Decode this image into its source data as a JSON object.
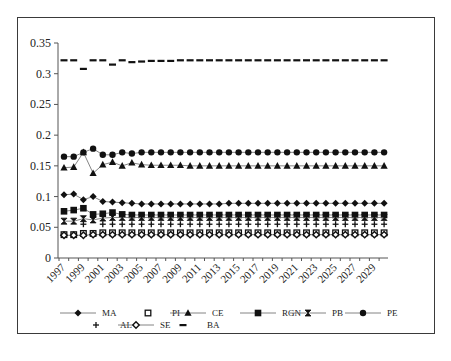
{
  "chart_data": {
    "type": "line",
    "title": "",
    "xlabel": "",
    "ylabel": "",
    "ylim": [
      0,
      0.35
    ],
    "yticks": [
      "0",
      "0.05",
      "0.1",
      "0.15",
      "0.2",
      "0.25",
      "0.3",
      "0.35"
    ],
    "xtick_labels": [
      "1997",
      "1999",
      "2001",
      "2003",
      "2005",
      "2007",
      "2009",
      "2011",
      "2013",
      "2015",
      "2017",
      "2019",
      "2021",
      "2023",
      "2025",
      "2027",
      "2029"
    ],
    "x": [
      1997,
      1998,
      1999,
      2000,
      2001,
      2002,
      2003,
      2004,
      2005,
      2006,
      2007,
      2008,
      2009,
      2010,
      2011,
      2012,
      2013,
      2014,
      2015,
      2016,
      2017,
      2018,
      2019,
      2020,
      2021,
      2022,
      2023,
      2024,
      2025,
      2026,
      2027,
      2028,
      2029,
      2030
    ],
    "grid": false,
    "legend_position": "bottom",
    "series": [
      {
        "name": "MA",
        "marker": "diamond",
        "line": true,
        "values": [
          0.103,
          0.104,
          0.095,
          0.1,
          0.092,
          0.091,
          0.09,
          0.089,
          0.088,
          0.088,
          0.088,
          0.088,
          0.088,
          0.088,
          0.088,
          0.088,
          0.088,
          0.089,
          0.089,
          0.089,
          0.089,
          0.089,
          0.089,
          0.089,
          0.089,
          0.089,
          0.089,
          0.089,
          0.089,
          0.089,
          0.089,
          0.089,
          0.089,
          0.089
        ]
      },
      {
        "name": "PI",
        "marker": "open-square",
        "line": false,
        "values": [
          0.038,
          0.038,
          0.04,
          0.04,
          0.041,
          0.041,
          0.041,
          0.041,
          0.041,
          0.041,
          0.041,
          0.041,
          0.041,
          0.041,
          0.041,
          0.041,
          0.041,
          0.041,
          0.041,
          0.041,
          0.041,
          0.041,
          0.041,
          0.041,
          0.041,
          0.041,
          0.041,
          0.041,
          0.041,
          0.041,
          0.041,
          0.041,
          0.041,
          0.041
        ]
      },
      {
        "name": "CE",
        "marker": "triangle",
        "line": true,
        "values": [
          0.147,
          0.148,
          0.172,
          0.138,
          0.152,
          0.156,
          0.15,
          0.155,
          0.152,
          0.151,
          0.151,
          0.151,
          0.151,
          0.15,
          0.15,
          0.15,
          0.15,
          0.15,
          0.15,
          0.15,
          0.15,
          0.15,
          0.15,
          0.15,
          0.15,
          0.15,
          0.15,
          0.15,
          0.15,
          0.15,
          0.15,
          0.15,
          0.15,
          0.15
        ]
      },
      {
        "name": "RGN",
        "marker": "square",
        "line": true,
        "values": [
          0.076,
          0.078,
          0.081,
          0.071,
          0.072,
          0.074,
          0.071,
          0.07,
          0.07,
          0.07,
          0.07,
          0.07,
          0.07,
          0.07,
          0.07,
          0.07,
          0.07,
          0.07,
          0.07,
          0.07,
          0.07,
          0.07,
          0.07,
          0.07,
          0.07,
          0.07,
          0.07,
          0.07,
          0.07,
          0.07,
          0.07,
          0.07,
          0.07,
          0.07
        ]
      },
      {
        "name": "PB",
        "marker": "hourglass",
        "line": true,
        "values": [
          0.06,
          0.06,
          0.064,
          0.062,
          0.065,
          0.066,
          0.066,
          0.066,
          0.066,
          0.066,
          0.066,
          0.066,
          0.066,
          0.066,
          0.066,
          0.066,
          0.066,
          0.066,
          0.066,
          0.066,
          0.066,
          0.066,
          0.066,
          0.066,
          0.066,
          0.066,
          0.066,
          0.066,
          0.066,
          0.066,
          0.066,
          0.066,
          0.066,
          0.066
        ]
      },
      {
        "name": "PE",
        "marker": "circle",
        "line": true,
        "values": [
          0.165,
          0.165,
          0.172,
          0.178,
          0.168,
          0.168,
          0.172,
          0.17,
          0.172,
          0.172,
          0.172,
          0.172,
          0.172,
          0.172,
          0.172,
          0.172,
          0.172,
          0.172,
          0.172,
          0.172,
          0.172,
          0.172,
          0.172,
          0.172,
          0.172,
          0.172,
          0.172,
          0.172,
          0.172,
          0.172,
          0.172,
          0.172,
          0.172,
          0.172
        ]
      },
      {
        "name": "AL",
        "marker": "plus",
        "line": false,
        "values": [
          null,
          null,
          0.055,
          null,
          0.055,
          0.055,
          0.055,
          0.055,
          0.055,
          0.055,
          0.055,
          0.055,
          0.055,
          0.055,
          0.055,
          0.055,
          0.055,
          0.055,
          0.055,
          0.055,
          0.055,
          0.055,
          0.055,
          0.055,
          0.055,
          0.055,
          0.055,
          0.055,
          0.055,
          0.055,
          0.055,
          0.055,
          0.055,
          0.055
        ]
      },
      {
        "name": "SE",
        "marker": "open-diamond",
        "line": true,
        "values": [
          0.037,
          0.037,
          0.037,
          0.038,
          0.038,
          0.038,
          0.038,
          0.038,
          0.038,
          0.038,
          0.038,
          0.038,
          0.038,
          0.038,
          0.038,
          0.038,
          0.038,
          0.038,
          0.038,
          0.038,
          0.038,
          0.038,
          0.038,
          0.038,
          0.038,
          0.038,
          0.038,
          0.038,
          0.038,
          0.038,
          0.038,
          0.038,
          0.038,
          0.038
        ]
      },
      {
        "name": "BA",
        "marker": "dash",
        "line": false,
        "values": [
          0.322,
          0.322,
          0.308,
          0.322,
          0.322,
          0.315,
          0.322,
          0.319,
          0.32,
          0.321,
          0.321,
          0.321,
          0.322,
          0.322,
          0.322,
          0.322,
          0.322,
          0.322,
          0.322,
          0.322,
          0.322,
          0.322,
          0.322,
          0.322,
          0.322,
          0.322,
          0.322,
          0.322,
          0.322,
          0.322,
          0.322,
          0.322,
          0.322,
          0.322
        ]
      }
    ]
  },
  "legend": {
    "row1": [
      "MA",
      "PI",
      "CE",
      "RGN",
      "PB",
      "PE"
    ],
    "row2": [
      "AL",
      "SE",
      "BA"
    ]
  }
}
